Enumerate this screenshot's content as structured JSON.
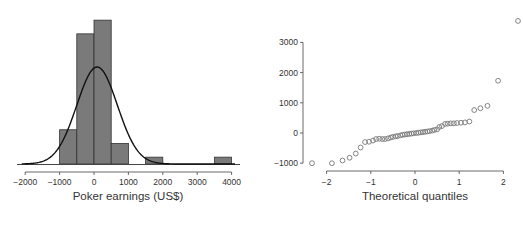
{
  "chart_data": [
    {
      "type": "bar",
      "subtype": "histogram",
      "title": "",
      "xlabel": "Poker earnings (US$)",
      "ylabel": "",
      "xlim": [
        -2000,
        4000
      ],
      "x_ticks": [
        -2000,
        -1000,
        0,
        1000,
        2000,
        3000,
        4000
      ],
      "x_tick_labels": [
        "−2000",
        "−1000",
        "0",
        "1000",
        "2000",
        "3000",
        "4000"
      ],
      "bins": [
        {
          "start": -1000,
          "end": -500,
          "count": 5
        },
        {
          "start": -500,
          "end": 0,
          "count": 19
        },
        {
          "start": 0,
          "end": 500,
          "count": 21
        },
        {
          "start": 500,
          "end": 1000,
          "count": 3
        },
        {
          "start": 1000,
          "end": 1500,
          "count": 0
        },
        {
          "start": 1500,
          "end": 2000,
          "count": 1
        },
        {
          "start": 2000,
          "end": 2500,
          "count": 0
        },
        {
          "start": 2500,
          "end": 3000,
          "count": 0
        },
        {
          "start": 3000,
          "end": 3500,
          "count": 0
        },
        {
          "start": 3500,
          "end": 4000,
          "count": 1
        }
      ],
      "overlay": {
        "type": "normal_density",
        "mean": 90,
        "sd": 590
      },
      "bar_color": "#7a7a7a",
      "grid": false
    },
    {
      "type": "scatter",
      "subtype": "normal_qq",
      "title": "",
      "xlabel": "Theoretical quantiles",
      "ylabel": "",
      "xlim": [
        -2.3,
        2.3
      ],
      "ylim": [
        -1000,
        3000
      ],
      "x_ticks": [
        -2,
        -1,
        0,
        1,
        2
      ],
      "x_tick_labels": [
        "−2",
        "−1",
        "0",
        "1",
        "2"
      ],
      "y_ticks": [
        -1000,
        0,
        1000,
        2000,
        3000
      ],
      "y_tick_labels": [
        "−1000",
        "0",
        "1000",
        "2000",
        "3000"
      ],
      "points": [
        [
          -2.33,
          -1000
        ],
        [
          -1.88,
          -1000
        ],
        [
          -1.64,
          -910
        ],
        [
          -1.48,
          -820
        ],
        [
          -1.34,
          -680
        ],
        [
          -1.23,
          -480
        ],
        [
          -1.13,
          -300
        ],
        [
          -1.04,
          -290
        ],
        [
          -0.95,
          -250
        ],
        [
          -0.88,
          -200
        ],
        [
          -0.81,
          -190
        ],
        [
          -0.74,
          -200
        ],
        [
          -0.68,
          -200
        ],
        [
          -0.61,
          -180
        ],
        [
          -0.55,
          -150
        ],
        [
          -0.5,
          -130
        ],
        [
          -0.44,
          -110
        ],
        [
          -0.39,
          -100
        ],
        [
          -0.33,
          -80
        ],
        [
          -0.28,
          -60
        ],
        [
          -0.23,
          -50
        ],
        [
          -0.18,
          -40
        ],
        [
          -0.13,
          -30
        ],
        [
          -0.08,
          -20
        ],
        [
          -0.03,
          -10
        ],
        [
          0.03,
          0
        ],
        [
          0.08,
          10
        ],
        [
          0.13,
          20
        ],
        [
          0.18,
          30
        ],
        [
          0.23,
          40
        ],
        [
          0.28,
          50
        ],
        [
          0.33,
          60
        ],
        [
          0.39,
          80
        ],
        [
          0.44,
          100
        ],
        [
          0.5,
          120
        ],
        [
          0.55,
          200
        ],
        [
          0.61,
          230
        ],
        [
          0.68,
          300
        ],
        [
          0.74,
          310
        ],
        [
          0.81,
          320
        ],
        [
          0.88,
          320
        ],
        [
          0.95,
          330
        ],
        [
          1.04,
          340
        ],
        [
          1.13,
          350
        ],
        [
          1.23,
          380
        ],
        [
          1.34,
          760
        ],
        [
          1.48,
          820
        ],
        [
          1.64,
          900
        ],
        [
          1.88,
          1730
        ],
        [
          2.33,
          3710
        ]
      ],
      "marker": "open-circle",
      "marker_color": "#777777",
      "grid": false
    }
  ],
  "caption_partial": "Figure ... (text cut off at bottom edge)"
}
